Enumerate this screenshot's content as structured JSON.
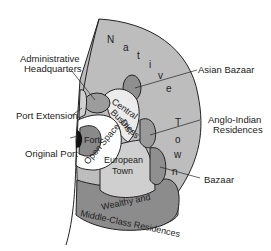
{
  "diagram": {
    "colors": {
      "native_town": "#bdbdbd",
      "bazaar": "#8f8f8f",
      "open_space": "#ffffff",
      "fort": "#8a8a8a",
      "original_port": "#111111",
      "european_town": "#cfcfcf",
      "wealthy_residences": "#8c8c8c",
      "cbd": "#ebebeb",
      "outline": "#222222"
    },
    "regions": {
      "native_town": {
        "letters": [
          "N",
          "a",
          "t",
          "i",
          "v",
          "e",
          "T",
          "o",
          "w",
          "n"
        ]
      },
      "central_business_district": {
        "line1": "Central",
        "line2": "Business",
        "line3": "Dist"
      },
      "fort": {
        "label": "Fort"
      },
      "open_space": {
        "label": "Open Space"
      },
      "european_town": {
        "line1": "European",
        "line2": "Town"
      },
      "wealthy_residences": {
        "line1": "Wealthy and",
        "line2": "Middle-Class Residences"
      }
    },
    "callouts": {
      "administrative_headquarters": {
        "line1": "Administrative",
        "line2": "Headquarters"
      },
      "port_extension": "Port Extension",
      "original_port": "Original Port",
      "asian_bazaar": "Asian Bazaar",
      "anglo_indian_residences": {
        "line1": "Anglo-Indian",
        "line2": "Residences"
      },
      "bazaar": "Bazaar"
    }
  }
}
